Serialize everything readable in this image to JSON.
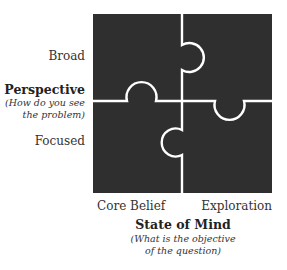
{
  "diagram": {
    "type": "2x2 puzzle matrix",
    "fill_color": "#2f2f2f",
    "seam_color": "#ffffff",
    "pieces": [
      {
        "position": "top-left"
      },
      {
        "position": "top-right"
      },
      {
        "position": "bottom-left"
      },
      {
        "position": "bottom-right"
      }
    ]
  },
  "y_axis": {
    "title": "Perspective",
    "subtitle_line1": "(How do you see",
    "subtitle_line2": "the problem)",
    "top_label": "Broad",
    "bottom_label": "Focused"
  },
  "x_axis": {
    "title": "State of Mind",
    "subtitle_line1": "(What is the objective",
    "subtitle_line2": "of the question)",
    "left_label": "Core Belief",
    "right_label": "Exploration"
  }
}
